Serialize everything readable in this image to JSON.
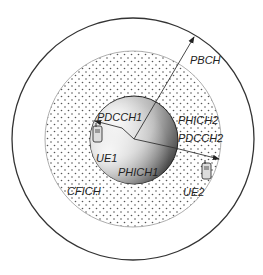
{
  "diagram": {
    "type": "cell coverage of LTE downlink control channels",
    "regions": [
      {
        "name": "outer-cell",
        "channel": "PBCH",
        "fill": "#ffffff"
      },
      {
        "name": "dotted-ring",
        "channel": "CFICH",
        "fill": "dotted"
      },
      {
        "name": "inner-sphere",
        "channels": [
          "PDCCH1",
          "PHICH1",
          "PHICH2",
          "PDCCH2"
        ],
        "fill": "gradient"
      }
    ],
    "labels": {
      "pbch": "PBCH",
      "pdcch1": "PDCCH1",
      "phich2": "PHICH2",
      "pdcch2": "PDCCH2",
      "ue1": "UE1",
      "phich1": "PHICH1",
      "cfich": "CFICH",
      "ue2": "UE2"
    },
    "devices": [
      {
        "id": "UE1",
        "icon": "mobile-phone-icon"
      },
      {
        "id": "UE2",
        "icon": "mobile-phone-icon"
      }
    ],
    "colors": {
      "stroke": "#333333",
      "dot": "#555555",
      "sphere_light": "#f4f4f4",
      "sphere_dark": "#222222"
    }
  }
}
